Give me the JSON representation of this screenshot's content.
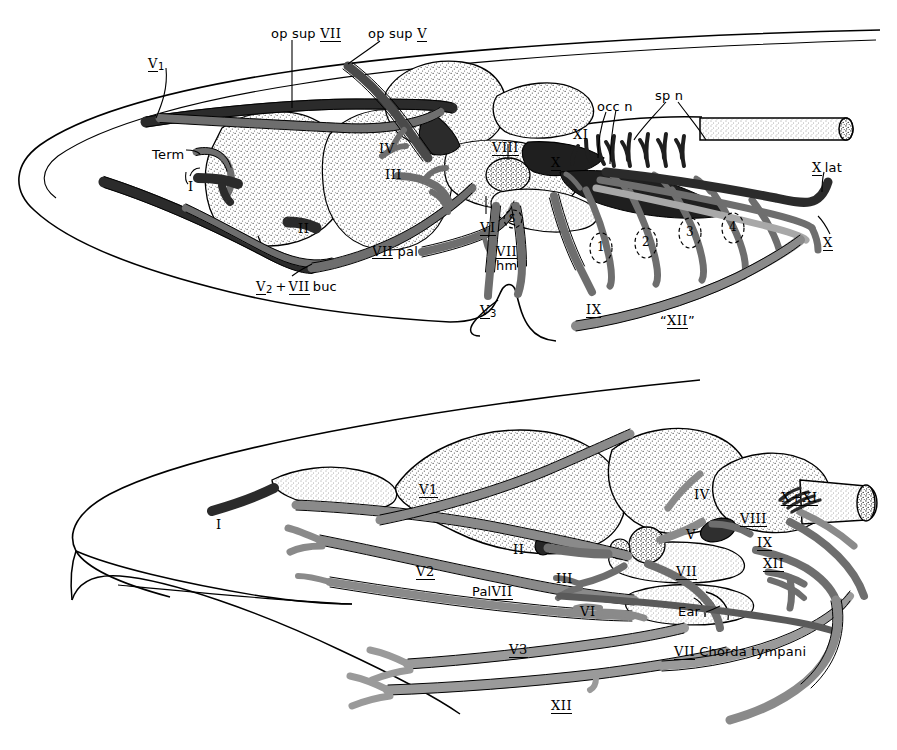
{
  "figure": {
    "panels": [
      {
        "id": "upper",
        "name": "upper-panel"
      },
      {
        "id": "lower",
        "name": "lower-panel"
      }
    ],
    "colors": {
      "ink": "#000000",
      "nerve_dark": "#2b2b2b",
      "nerve_mid": "#6e6e6e",
      "nerve_light": "#a8a8a8",
      "nerve_pale": "#cfcfcf",
      "brain_fill": "#ffffff",
      "background": "#ffffff"
    }
  },
  "upper_panel": {
    "name": "upper-panel",
    "labels": [
      {
        "id": "op_sup_vii",
        "text_a": "op  sup",
        "numeral": "VII",
        "underline": true,
        "x": 271,
        "y": 27
      },
      {
        "id": "op_sup_v",
        "text_a": "op  sup",
        "numeral": "V",
        "underline": true,
        "x": 368,
        "y": 27
      },
      {
        "id": "v1",
        "text_a": "",
        "numeral": "V",
        "sub": "1",
        "underline": true,
        "x": 148,
        "y": 57
      },
      {
        "id": "term",
        "text_a": "Term",
        "numeral": "",
        "underline": false,
        "x": 152,
        "y": 148
      },
      {
        "id": "i_upper",
        "text_a": "",
        "numeral": "I",
        "underline": false,
        "x": 188,
        "y": 180
      },
      {
        "id": "ii_upper",
        "text_a": "",
        "numeral": "II",
        "underline": false,
        "x": 298,
        "y": 222
      },
      {
        "id": "iii_upper",
        "text_a": "",
        "numeral": "III",
        "underline": false,
        "x": 385,
        "y": 168
      },
      {
        "id": "iv_upper",
        "text_a": "",
        "numeral": "IV",
        "underline": false,
        "x": 379,
        "y": 142
      },
      {
        "id": "viii_upper",
        "text_a": "",
        "numeral": "VIII",
        "underline": true,
        "x": 492,
        "y": 141
      },
      {
        "id": "vi_upper",
        "text_a": "",
        "numeral": "VI",
        "underline": true,
        "x": 480,
        "y": 221
      },
      {
        "id": "s_ganglion",
        "text_a": "S",
        "numeral": "",
        "underline": false,
        "x": 512,
        "y": 221
      },
      {
        "id": "vii_pal",
        "text_a": "pal",
        "numeral": "VII",
        "underline": true,
        "x": 372,
        "y": 251
      },
      {
        "id": "vii_hm",
        "text_a": "hm",
        "numeral": "VII",
        "underline": true,
        "x": 500,
        "y": 252
      },
      {
        "id": "v2_vii_buc",
        "text_a": "+ buc",
        "numeral": "V",
        "sub": "2",
        "underline": true,
        "x": 256,
        "y": 280
      },
      {
        "id": "v3_upper",
        "text_a": "",
        "numeral": "V",
        "sub": "3",
        "underline": true,
        "x": 480,
        "y": 304
      },
      {
        "id": "ix_upper",
        "text_a": "",
        "numeral": "IX",
        "underline": true,
        "x": 586,
        "y": 303
      },
      {
        "id": "xi_upper",
        "text_a": "",
        "numeral": "XI",
        "underline": false,
        "x": 573,
        "y": 128
      },
      {
        "id": "x_upper_top",
        "text_a": "",
        "numeral": "X",
        "underline": true,
        "x": 551,
        "y": 156
      },
      {
        "id": "occ_n",
        "text_a": "occ n",
        "numeral": "",
        "underline": false,
        "x": 597,
        "y": 106
      },
      {
        "id": "sp_n",
        "text_a": "sp n",
        "numeral": "",
        "underline": false,
        "x": 655,
        "y": 96
      },
      {
        "id": "x_lat",
        "text_a": "lat",
        "numeral": "X",
        "underline": true,
        "x": 812,
        "y": 165
      },
      {
        "id": "x_lower",
        "text_a": "",
        "numeral": "X",
        "underline": true,
        "x": 823,
        "y": 239
      },
      {
        "id": "xii_quoted",
        "text_a": "“ ”",
        "numeral": "XII",
        "underline": true,
        "x": 663,
        "y": 318
      }
    ],
    "ganglia": [
      {
        "id": "g1",
        "number": "1",
        "x": 600,
        "y": 250
      },
      {
        "id": "g2",
        "number": "2",
        "x": 645,
        "y": 244
      },
      {
        "id": "g3",
        "number": "3",
        "x": 689,
        "y": 234
      },
      {
        "id": "g4",
        "number": "4",
        "x": 731,
        "y": 229
      }
    ],
    "label_text": {
      "op_sup_vii": "op  sup VII",
      "op_sup_v": "op  sup V",
      "v1": "V1",
      "term": "Term",
      "i": "I",
      "ii": "II",
      "iii": "III",
      "iv": "IV",
      "viii": "VIII",
      "vi": "VI",
      "s": "S",
      "vii_pal": "VII pal",
      "vii_hm": "VII hm",
      "v2_vii_buc": "V2 + VII buc",
      "v3": "V3",
      "ix": "IX",
      "xi": "XI",
      "x": "X",
      "occ_n": "occ n",
      "sp_n": "sp n",
      "x_lat": "X lat",
      "xii": "“XII”"
    }
  },
  "lower_panel": {
    "name": "lower-panel",
    "label_text": {
      "i": "I",
      "v1": "V1",
      "v2": "V2",
      "v3": "V3",
      "ii": "II",
      "iii": "III",
      "iv": "IV",
      "v": "V",
      "vi": "VI",
      "vii": "VII",
      "viii": "VIII",
      "ix": "IX",
      "x_xi": "X+XI",
      "xii": "XII",
      "pal_vii": "Pal VII",
      "ear": "Ear",
      "vii_chorda_tympani": "VII Chorda tympani"
    },
    "labels": [
      {
        "id": "i_lower",
        "text_a": "",
        "numeral": "I",
        "underline": false,
        "x": 216,
        "y": 518
      },
      {
        "id": "v1_lower",
        "text_a": "",
        "numeral": "V1",
        "underline": true,
        "x": 419,
        "y": 483
      },
      {
        "id": "v2_lower",
        "text_a": "",
        "numeral": "V2",
        "underline": true,
        "x": 416,
        "y": 565
      },
      {
        "id": "v3_lower",
        "text_a": "",
        "numeral": "V3",
        "underline": true,
        "x": 509,
        "y": 643
      },
      {
        "id": "ii_lower",
        "text_a": "",
        "numeral": "II",
        "underline": false,
        "x": 513,
        "y": 543
      },
      {
        "id": "iii_lower",
        "text_a": "",
        "numeral": "III",
        "underline": false,
        "x": 556,
        "y": 572
      },
      {
        "id": "iv_lower",
        "text_a": "",
        "numeral": "IV",
        "underline": false,
        "x": 694,
        "y": 493
      },
      {
        "id": "v_lower",
        "text_a": "",
        "numeral": "V",
        "underline": false,
        "x": 686,
        "y": 530
      },
      {
        "id": "vi_lower",
        "text_a": "",
        "numeral": "VI",
        "underline": false,
        "x": 580,
        "y": 607
      },
      {
        "id": "vii_lower",
        "text_a": "",
        "numeral": "VII",
        "underline": true,
        "x": 676,
        "y": 567
      },
      {
        "id": "viii_lower",
        "text_a": "",
        "numeral": "VIII",
        "underline": true,
        "x": 740,
        "y": 517
      },
      {
        "id": "ix_lower",
        "text_a": "",
        "numeral": "IX",
        "underline": true,
        "x": 757,
        "y": 539
      },
      {
        "id": "xii_side",
        "text_a": "",
        "numeral": "XII",
        "underline": true,
        "x": 765,
        "y": 560
      },
      {
        "id": "x_xi",
        "text_a": "",
        "numeral": "X+XI",
        "underline": true,
        "x": 786,
        "y": 496
      },
      {
        "id": "pal_vii",
        "text_a": "Pal",
        "numeral": "VII",
        "underline": true,
        "x": 478,
        "y": 590
      },
      {
        "id": "ear",
        "text_a": "Ear",
        "numeral": "",
        "underline": false,
        "x": 682,
        "y": 611
      },
      {
        "id": "chorda",
        "text_a": "Chorda tympani",
        "numeral": "VII",
        "underline": true,
        "x": 676,
        "y": 650
      },
      {
        "id": "xii_lower",
        "text_a": "",
        "numeral": "XII",
        "underline": true,
        "x": 551,
        "y": 703
      }
    ]
  }
}
